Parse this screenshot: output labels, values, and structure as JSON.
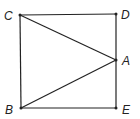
{
  "diagram": {
    "points": {
      "C": {
        "label": "C",
        "x": 20,
        "y": 15,
        "lx": 4,
        "ly": 20
      },
      "D": {
        "label": "D",
        "x": 116,
        "y": 14,
        "lx": 121,
        "ly": 19
      },
      "A": {
        "label": "A",
        "x": 116,
        "y": 60,
        "lx": 122,
        "ly": 65
      },
      "B": {
        "label": "B",
        "x": 21,
        "y": 108,
        "lx": 5,
        "ly": 114
      },
      "E": {
        "label": "E",
        "x": 116,
        "y": 108,
        "lx": 122,
        "ly": 114
      }
    },
    "segments": [
      [
        "C",
        "D"
      ],
      [
        "D",
        "A"
      ],
      [
        "A",
        "E"
      ],
      [
        "E",
        "B"
      ],
      [
        "B",
        "C"
      ],
      [
        "C",
        "A"
      ],
      [
        "B",
        "A"
      ]
    ],
    "stroke_color": "#222222"
  }
}
